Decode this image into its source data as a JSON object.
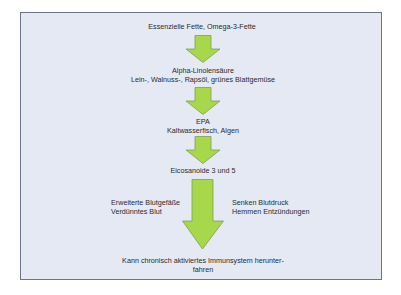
{
  "diagram": {
    "colors": {
      "background": "#e4e9f4",
      "border": "#6e7386",
      "arrow_fill": "#a6d84a",
      "arrow_stroke": "#7f9f56",
      "text": "#2b2b2b"
    },
    "nodes": [
      {
        "id": "n1",
        "lines": [
          "Essenzielle Fette, Omega-3-Fette"
        ]
      },
      {
        "id": "n2",
        "lines": [
          "Alpha-Linolensäure",
          "Lein-, Walnuss-, Rapsöl, grünes Blattgemüse"
        ]
      },
      {
        "id": "n3",
        "lines": [
          "EPA",
          "Kaltwasserfisch, Algen"
        ]
      },
      {
        "id": "n4",
        "lines": [
          "Eicosanoide 3 und 5"
        ]
      },
      {
        "id": "n5",
        "lines": [
          "Kann chronisch aktiviertes Immunsystem herunter-",
          "fahren"
        ]
      }
    ],
    "side_notes": {
      "left": [
        "Erweiterte Blutgefäße",
        "Verdünntes Blut"
      ],
      "right": [
        "Senken Blutdruck",
        "Hemmen Entzündungen"
      ]
    },
    "arrows": [
      {
        "from": "n1",
        "to": "n2",
        "icon": "arrow-down-icon"
      },
      {
        "from": "n2",
        "to": "n3",
        "icon": "arrow-down-icon"
      },
      {
        "from": "n3",
        "to": "n4",
        "icon": "arrow-down-icon"
      },
      {
        "from": "n4",
        "to": "n5",
        "icon": "arrow-down-icon",
        "size": "large"
      }
    ]
  }
}
